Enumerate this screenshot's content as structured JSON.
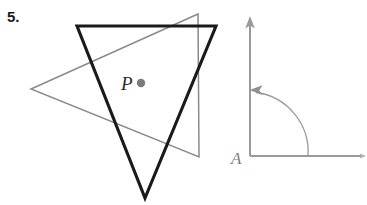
{
  "problem": {
    "number_label": "5."
  },
  "colors": {
    "background": "#ffffff",
    "preimage_stroke": "#1a1a1a",
    "image_stroke": "#8a8a8a",
    "center_point_fill": "#7b7b7b",
    "point_label_color": "#2b2b2b",
    "angle_stroke": "#9a9a9a",
    "angle_label_color": "#7d7d7d"
  },
  "left_figure": {
    "name": "rotation-figure",
    "center_point": {
      "label": "P",
      "x": 141,
      "y": 83,
      "radius": 4.2
    },
    "preimage_triangle": {
      "name": "black-triangle",
      "stroke_width": 3.1,
      "points": "77,26 216,26 145,198",
      "vertices": [
        {
          "x": 77,
          "y": 26
        },
        {
          "x": 216,
          "y": 26
        },
        {
          "x": 145,
          "y": 198
        }
      ]
    },
    "image_triangle": {
      "name": "gray-triangle",
      "stroke_width": 1.5,
      "points": "198,14 31,89 199,157",
      "vertices": [
        {
          "x": 198,
          "y": 14
        },
        {
          "x": 31,
          "y": 89
        },
        {
          "x": 199,
          "y": 157
        }
      ]
    }
  },
  "right_figure": {
    "name": "rotation-angle-figure",
    "vertex_label": "A",
    "vertex": {
      "x": 250,
      "y": 156
    },
    "vertical_ray": {
      "x1": 250,
      "y1": 156,
      "x2": 250,
      "y2": 22,
      "arrow_tip_y": 17,
      "stroke_width": 2.0
    },
    "horizontal_ray": {
      "x1": 250,
      "y1": 156,
      "x2": 363,
      "y2": 156,
      "stroke_width": 2.0
    },
    "arc": {
      "start": {
        "x": 308,
        "y": 156
      },
      "end": {
        "x": 256,
        "y": 92
      },
      "radius": 62,
      "direction": "counterclockwise",
      "stroke_width": 1.3,
      "arrow_tip": {
        "x": 250,
        "y": 90
      }
    },
    "label_position": {
      "x": 231,
      "y": 164
    }
  }
}
